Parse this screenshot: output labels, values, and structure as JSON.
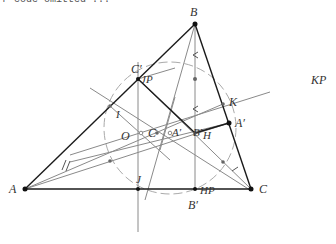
{
  "header": {
    "clipped_text": "r code omitted ..."
  },
  "diagram": {
    "type": "triangle-construction",
    "points": {
      "A": {
        "label": "A",
        "x": 25,
        "y": 189
      },
      "B": {
        "label": "B",
        "x": 195,
        "y": 24
      },
      "C": {
        "label": "C",
        "x": 251,
        "y": 189
      },
      "C_prime": {
        "label": "C′",
        "x": 138,
        "y": 79
      },
      "A_prime": {
        "label": "A′",
        "x": 229,
        "y": 123
      },
      "B_prime": {
        "label": "B′",
        "x": 195,
        "y": 189
      },
      "K": {
        "label": "K",
        "x": 223,
        "y": 104
      },
      "I": {
        "label": "I",
        "x": 110,
        "y": 106
      },
      "J": {
        "label": "J",
        "x": 138,
        "y": 189
      },
      "O": {
        "label": "O",
        "x": 137,
        "y": 133
      },
      "C2": {
        "label": "C",
        "x": 157,
        "y": 133
      },
      "A2": {
        "label": "A′",
        "x": 168,
        "y": 133
      },
      "B2": {
        "label": "B′",
        "x": 195,
        "y": 133
      },
      "H": {
        "label": "H",
        "x": 199,
        "y": 136
      }
    },
    "labels": {
      "A": "A",
      "B": "B",
      "C": "C",
      "C_prime": "C′",
      "JP": "JP",
      "A_prime": "A′",
      "B_prime": "B′",
      "K": "K",
      "KP": "KP",
      "I": "I",
      "O": "O",
      "C_center": "C",
      "A_center": "A′",
      "B_center": "B′",
      "H": "H",
      "J": "J",
      "HP": "HP"
    },
    "colors": {
      "triangle": "#1a1a1a",
      "construction": "#888888",
      "circle": "#aaaaaa",
      "point": "#111111"
    }
  }
}
